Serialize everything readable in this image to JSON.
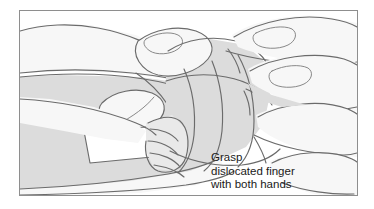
{
  "figure": {
    "kind": "medical-line-illustration",
    "caption_lines": [
      "Grasp",
      "dislocated finger",
      "with both hands"
    ],
    "caption_text": "Grasp dislocated finger with both hands",
    "colors": {
      "page_background": "#ffffff",
      "frame_border": "#8e8e8e",
      "outline_stroke": "#6b6b6b",
      "outline_stroke_dark": "#555555",
      "skin_light": "#f7f7f7",
      "skin_mid": "#e6e6e6",
      "skin_shade": "#d8d8d8",
      "highlight_white": "#ffffff",
      "caption_text": "#1a1a1a"
    },
    "frame": {
      "left": 19,
      "top": 10,
      "width": 339,
      "height": 186
    }
  }
}
